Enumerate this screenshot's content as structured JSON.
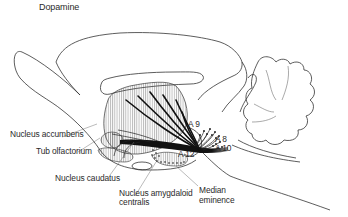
{
  "figure": {
    "title": "Dopamine",
    "type": "anatomical diagram - sagittal section of rat brain showing dopaminergic pathways"
  },
  "labels": {
    "nucleus_accumbens": "Nucleus accumbens",
    "tub_olfactorium": "Tub olfactorium",
    "nucleus_caudatus": "Nucleus caudatus",
    "nucleus_amygdaloid_line1": "Nucleus amygdaloid",
    "nucleus_amygdaloid_line2": "centralis",
    "median_eminence_line1": "Median",
    "median_eminence_line2": "eminence",
    "a9": "A 9",
    "a8": "A 8",
    "a10": "A 10",
    "a12": "A 12"
  },
  "colors": {
    "line": "#333333",
    "fiber": "#111111",
    "text": "#2a2a2a",
    "background": "#ffffff"
  }
}
